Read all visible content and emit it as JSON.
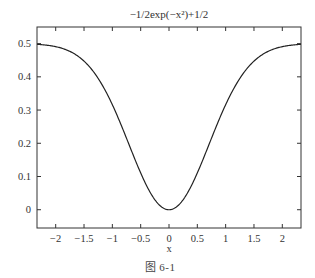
{
  "chart_data": {
    "type": "line",
    "title": "−1/2exp(−x²)+1/2",
    "xlabel": "x",
    "ylabel": "",
    "xlim": [
      -2.33,
      2.33
    ],
    "ylim": [
      -0.055,
      0.55
    ],
    "xticks": [
      -2,
      -1.5,
      -1,
      -0.5,
      0,
      0.5,
      1,
      1.5,
      2
    ],
    "xtick_labels": [
      "−2",
      "−1.5",
      "−1",
      "−0.5",
      "0",
      "0.5",
      "1",
      "1.5",
      "2"
    ],
    "yticks": [
      0,
      0.1,
      0.2,
      0.3,
      0.4,
      0.5
    ],
    "ytick_labels": [
      "0",
      "0.1",
      "0.2",
      "0.3",
      "0.4",
      "0.5"
    ],
    "grid": false,
    "legend": null,
    "series": [
      {
        "name": "-1/2exp(-x^2)+1/2",
        "function": "y = -0.5*exp(-x^2) + 0.5",
        "color": "#222222",
        "x": [
          -2.33,
          -2.0,
          -1.5,
          -1.0,
          -0.5,
          0,
          0.5,
          1.0,
          1.5,
          2.0,
          2.33
        ],
        "values": [
          0.498,
          0.491,
          0.447,
          0.316,
          0.111,
          0.0,
          0.111,
          0.316,
          0.447,
          0.491,
          0.498
        ]
      }
    ]
  },
  "caption": "图 6-1"
}
